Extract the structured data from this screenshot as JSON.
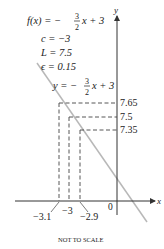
{
  "header": {
    "function_lhs": "f(x) = −",
    "frac_num": "3",
    "frac_den": "2",
    "function_rhs": "x + 3",
    "c_line": "c = −3",
    "L_line": "L = 7.5",
    "eps_line": "ϵ = 0.15"
  },
  "line_label": {
    "lhs": "y = −",
    "frac_num": "3",
    "frac_den": "2",
    "rhs": "x + 3"
  },
  "axes": {
    "x_label": "x",
    "y_label": "y",
    "origin_label": "0"
  },
  "y_ticks": [
    "7.65",
    "7.5",
    "7.35"
  ],
  "x_ticks": [
    "−3.1",
    "−3",
    "−2.9"
  ],
  "footer": {
    "note": "NOT TO SCALE"
  },
  "colors": {
    "graph_line": "#b8b8b8",
    "axis": "#333333",
    "dash": "#444444"
  }
}
